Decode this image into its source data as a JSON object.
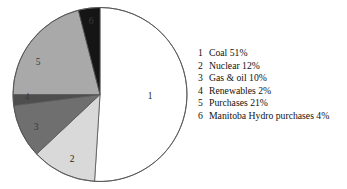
{
  "chart_data": {
    "type": "pie",
    "title": "",
    "categories": [
      "Coal",
      "Nuclear",
      "Gas & oil",
      "Renewables",
      "Purchases",
      "Manitoba Hydro purchases"
    ],
    "values": [
      51,
      12,
      10,
      2,
      21,
      4
    ],
    "unit": "%",
    "start_angle_deg": 0,
    "direction": "clockwise",
    "legend_position": "right",
    "grid": false,
    "slice_colors": [
      "#ffffff",
      "#d9d9d9",
      "#6f6f6f",
      "#4e4e4e",
      "#a9a9a9",
      "#151515"
    ],
    "outline_color": "#555555",
    "slices": [
      {
        "key": "1",
        "label": "Coal",
        "value": 51,
        "percent_text": "51%",
        "color": "#ffffff",
        "label_x": 150,
        "label_y": 97,
        "label_dark": false
      },
      {
        "key": "2",
        "label": "Nuclear",
        "value": 12,
        "percent_text": "12%",
        "color": "#d9d9d9",
        "label_x": 72,
        "label_y": 160,
        "label_dark": false
      },
      {
        "key": "3",
        "label": "Gas & oil",
        "value": 10,
        "percent_text": "10%",
        "color": "#6f6f6f",
        "label_x": 36,
        "label_y": 128,
        "label_dark": true
      },
      {
        "key": "4",
        "label": "Renewables",
        "value": 2,
        "percent_text": "2%",
        "color": "#4e4e4e",
        "label_x": 27,
        "label_y": 98,
        "label_dark": true
      },
      {
        "key": "5",
        "label": "Purchases",
        "value": 21,
        "percent_text": "21%",
        "color": "#a9a9a9",
        "label_x": 38,
        "label_y": 63,
        "label_dark": true
      },
      {
        "key": "6",
        "label": "Manitoba Hydro purchases",
        "value": 4,
        "percent_text": "4%",
        "color": "#151515",
        "label_x": 91,
        "label_y": 22,
        "label_dark": true
      }
    ]
  },
  "legend": {
    "items": [
      {
        "num": "1",
        "text": "Coal 51%"
      },
      {
        "num": "2",
        "text": "Nuclear 12%"
      },
      {
        "num": "3",
        "text": "Gas & oil 10%"
      },
      {
        "num": "4",
        "text": "Renewables 2%"
      },
      {
        "num": "5",
        "text": "Purchases 21%"
      },
      {
        "num": "6",
        "text": "Manitoba Hydro purchases 4%"
      }
    ]
  }
}
